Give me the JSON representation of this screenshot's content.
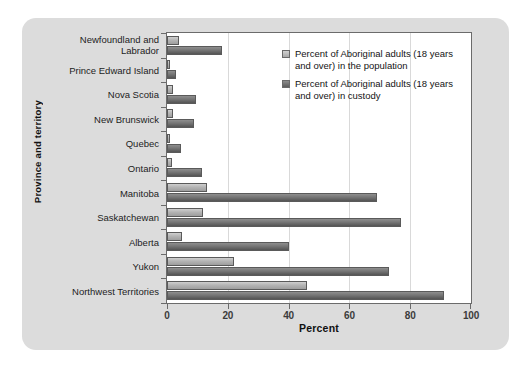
{
  "chart_data": {
    "type": "bar",
    "orientation": "horizontal",
    "title": "",
    "xlabel": "Percent",
    "ylabel": "Province and territory",
    "xlim": [
      0,
      100
    ],
    "xticks": [
      0,
      20,
      40,
      60,
      80,
      100
    ],
    "grid": "vertical-dotted",
    "legend_position": "top-right-inside",
    "categories": [
      "Newfoundland and Labrador",
      "Prince Edward Island",
      "Nova Scotia",
      "New Brunswick",
      "Quebec",
      "Ontario",
      "Manitoba",
      "Saskatchewan",
      "Alberta",
      "Yukon",
      "Northwest Territories"
    ],
    "series": [
      {
        "name": "Percent of Aboriginal adults (18 years and over) in the population",
        "short_name": "population",
        "color": "#b4b4b4",
        "values": [
          4,
          1,
          2,
          2,
          1,
          1.5,
          13,
          12,
          5,
          22,
          46
        ]
      },
      {
        "name": "Percent of Aboriginal adults (18 years and over) in custody",
        "short_name": "custody",
        "color": "#6e6e6e",
        "values": [
          18,
          3,
          9.5,
          9,
          4.5,
          11.5,
          69,
          77,
          40,
          73,
          91
        ]
      }
    ]
  },
  "axis": {
    "x_title": "Percent",
    "y_title": "Province and territory",
    "x_tick_labels": [
      "0",
      "20",
      "40",
      "60",
      "80",
      "100"
    ]
  },
  "legend": {
    "items": [
      {
        "label": "Percent of Aboriginal adults (18 years and over) in the population",
        "swatch": "light-gray"
      },
      {
        "label": "Percent of Aboriginal adults (18 years and over) in custody",
        "swatch": "dark-gray"
      }
    ]
  },
  "colors": {
    "panel_background": "#dcdcdc",
    "plot_background": "#ffffff",
    "axis_line": "#6b6b6b",
    "gridline": "#d9d9d9",
    "series_population": "#b4b4b4",
    "series_custody": "#6e6e6e"
  }
}
